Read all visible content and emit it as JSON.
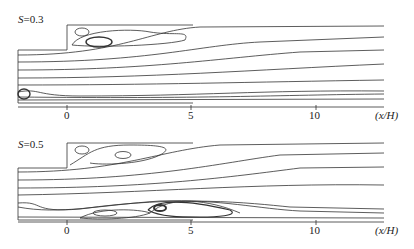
{
  "figure": {
    "panels": [
      {
        "label_var": "S",
        "label_value": "=0.3",
        "x_ticks": [
          "0",
          "5",
          "10"
        ],
        "x_axis_label": "(x/H)"
      },
      {
        "label_var": "S",
        "label_value": "=0.5",
        "x_ticks": [
          "0",
          "5",
          "10"
        ],
        "x_axis_label": "(x/H)"
      }
    ]
  }
}
